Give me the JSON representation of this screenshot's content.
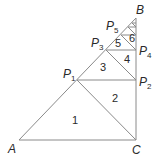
{
  "diagram": {
    "vertices": {
      "A": {
        "label": "A",
        "sub": ""
      },
      "B": {
        "label": "B",
        "sub": ""
      },
      "C": {
        "label": "C",
        "sub": ""
      },
      "P1": {
        "label": "P",
        "sub": "1"
      },
      "P2": {
        "label": "P",
        "sub": "2"
      },
      "P3": {
        "label": "P",
        "sub": "3"
      },
      "P4": {
        "label": "P",
        "sub": "4"
      },
      "P5": {
        "label": "P",
        "sub": "5"
      }
    },
    "regions": [
      "1",
      "2",
      "3",
      "4",
      "5",
      "6"
    ],
    "line_color": "#8a8a8a",
    "text_color": "#2a2a2a"
  }
}
